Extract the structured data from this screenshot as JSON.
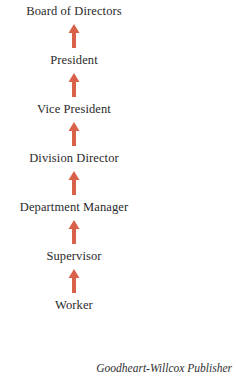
{
  "diagram": {
    "type": "vertical-hierarchy-flow",
    "background_color": "#ffffff",
    "text_color": "#2a2a2a",
    "arrow_color": "#d9614a",
    "arrow_icon_name": "arrow-up-icon",
    "arrow_direction": "up",
    "levels": [
      {
        "label": "Board of Directors",
        "rank": 7
      },
      {
        "label": "President",
        "rank": 6
      },
      {
        "label": "Vice President",
        "rank": 5
      },
      {
        "label": "Division Director",
        "rank": 4
      },
      {
        "label": "Department Manager",
        "rank": 3
      },
      {
        "label": "Supervisor",
        "rank": 2
      },
      {
        "label": "Worker",
        "rank": 1
      }
    ],
    "connectors": [
      {
        "from": "President",
        "to": "Board of Directors"
      },
      {
        "from": "Vice President",
        "to": "President"
      },
      {
        "from": "Division Director",
        "to": "Vice President"
      },
      {
        "from": "Department Manager",
        "to": "Division Director"
      },
      {
        "from": "Supervisor",
        "to": "Department Manager"
      },
      {
        "from": "Worker",
        "to": "Supervisor"
      }
    ]
  },
  "credit": {
    "text": "Goodheart-Willcox Publisher"
  }
}
